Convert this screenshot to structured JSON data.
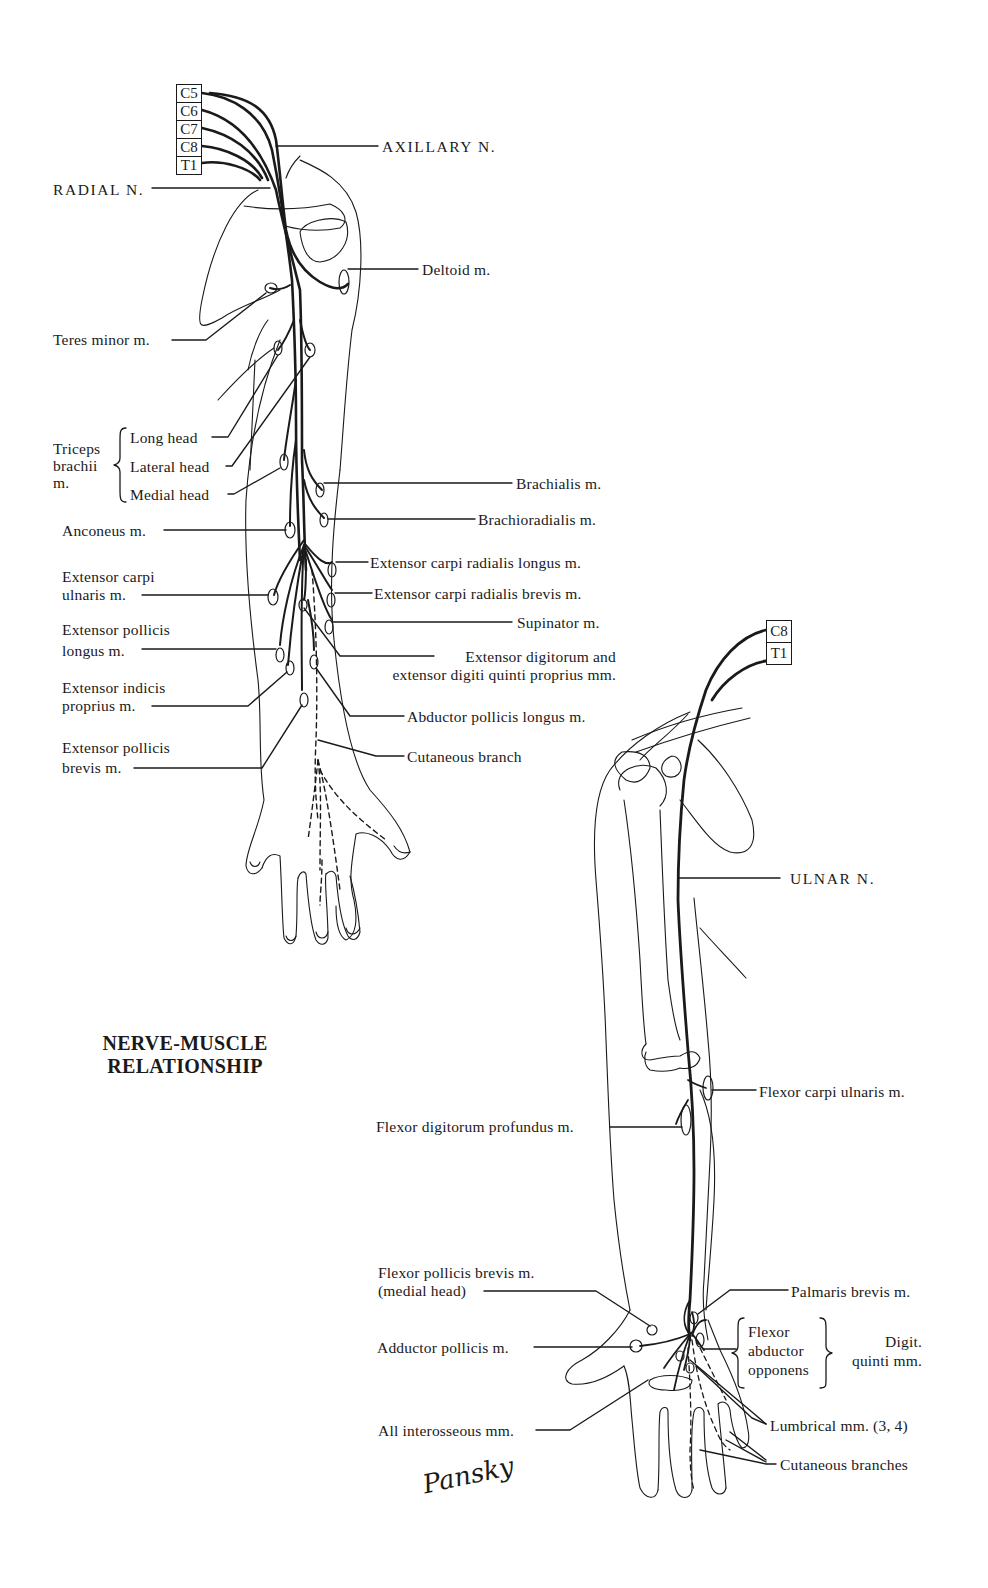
{
  "title": {
    "line1": "NERVE-MUSCLE",
    "line2": "RELATIONSHIP"
  },
  "signature": "Pansky",
  "radial_figure": {
    "roots": [
      "C5",
      "C6",
      "C7",
      "C8",
      "T1"
    ],
    "nerves": {
      "axillary": "AXILLARY N.",
      "radial": "RADIAL N."
    },
    "left_labels": {
      "teres_minor": "Teres minor m.",
      "triceps_group": "Triceps brachii m.",
      "triceps_line1": "Triceps",
      "triceps_line2": "brachii",
      "triceps_line3": "m.",
      "long_head": "Long head",
      "lateral_head": "Lateral head",
      "medial_head": "Medial head",
      "anconeus": "Anconeus m.",
      "ecu_line1": "Extensor carpi",
      "ecu_line2": "ulnaris m.",
      "epl_line1": "Extensor pollicis",
      "epl_line2": "longus m.",
      "eip_line1": "Extensor indicis",
      "eip_line2": "proprius m.",
      "epb_line1": "Extensor pollicis",
      "epb_line2": "brevis m."
    },
    "right_labels": {
      "deltoid": "Deltoid m.",
      "brachialis": "Brachialis m.",
      "brachioradialis": "Brachioradialis m.",
      "ecrl": "Extensor carpi radialis longus m.",
      "ecrb": "Extensor carpi radialis brevis m.",
      "supinator": "Supinator m.",
      "ed_line1": "Extensor digitorum and",
      "ed_line2": "extensor digiti quinti proprius mm.",
      "apl": "Abductor pollicis longus m.",
      "cutaneous": "Cutaneous branch"
    }
  },
  "ulnar_figure": {
    "roots": [
      "C8",
      "T1"
    ],
    "nerve": "ULNAR N.",
    "labels": {
      "fcu": "Flexor carpi ulnaris m.",
      "fdp": "Flexor digitorum profundus m.",
      "fpb_line1": "Flexor pollicis brevis m.",
      "fpb_line2": "(medial head)",
      "adductor_pollicis": "Adductor pollicis m.",
      "palmaris_brevis": "Palmaris brevis m.",
      "digiti_flexor": "Flexor",
      "digiti_abductor": "abductor",
      "digiti_opponens": "opponens",
      "digiti_group_line1": "Digit.",
      "digiti_group_line2": "quinti mm.",
      "interosseous": "All interosseous mm.",
      "lumbrical": "Lumbrical mm. (3, 4)",
      "cutaneous": "Cutaneous branches"
    }
  }
}
